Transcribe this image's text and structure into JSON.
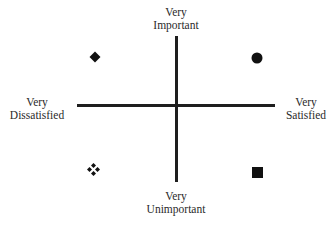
{
  "diagram": {
    "type": "quadrant",
    "axes": {
      "vertical": {
        "top_label": [
          "Very",
          "Important"
        ],
        "bottom_label": [
          "Very",
          "Unimportant"
        ]
      },
      "horizontal": {
        "left_label": [
          "Very",
          "Dissatisfied"
        ],
        "right_label": [
          "Very",
          "Satisfied"
        ]
      }
    },
    "quadrants": [
      {
        "position": "top-left",
        "marker": "diamond-icon"
      },
      {
        "position": "top-right",
        "marker": "circle-icon"
      },
      {
        "position": "bottom-left",
        "marker": "four-diamonds-icon"
      },
      {
        "position": "bottom-right",
        "marker": "square-icon"
      }
    ],
    "colors": {
      "line": "#1e1e1e",
      "marker": "#111111",
      "text": "#2a2a2a"
    }
  }
}
